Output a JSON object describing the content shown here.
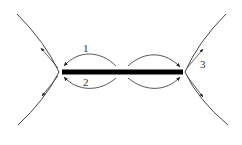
{
  "diagram": {
    "type": "crack-tip branching / edge loop schematic",
    "colors": {
      "line": "#444444",
      "bar": "#000000",
      "background": "#ffffff"
    },
    "labels": [
      {
        "id": "1",
        "text": "1",
        "x": 86,
        "y": 50
      },
      {
        "id": "2",
        "text": "2",
        "x": 86,
        "y": 85
      },
      {
        "id": "3",
        "text": "3",
        "x": 202,
        "y": 66
      }
    ],
    "elements": {
      "thick_bar": {
        "x1": 62,
        "x2": 183,
        "y": 72,
        "thickness": 5
      },
      "left_vertex": {
        "x": 60,
        "y": 72
      },
      "right_vertex": {
        "x": 184,
        "y": 72
      }
    }
  }
}
